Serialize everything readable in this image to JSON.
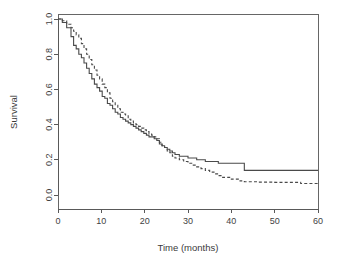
{
  "figure": {
    "background_color": "#ffffff",
    "ink_color": "#4a4a4a",
    "width": 337,
    "height": 265
  },
  "chart_data": {
    "type": "line",
    "title": "",
    "subtitle": "",
    "xlabel": "Time (months)",
    "ylabel": "Survival",
    "xlim": [
      0,
      60
    ],
    "ylim": [
      0,
      1.0
    ],
    "xticks": [
      0,
      10,
      20,
      30,
      40,
      50,
      60
    ],
    "xtick_labels": [
      "0",
      "10",
      "20",
      "30",
      "40",
      "50",
      "60"
    ],
    "yticks": [
      0.0,
      0.2,
      0.4,
      0.6,
      0.8,
      1.0
    ],
    "ytick_labels": [
      "0.0",
      "0.2",
      "0.4",
      "0.6",
      "0.8",
      "1.0"
    ],
    "grid": false,
    "legend": null,
    "legend_position": "none",
    "annotations": [],
    "plot_style": "kaplan-meier-step",
    "series": [
      {
        "name": "Group 1",
        "style": "solid",
        "color": "#4a4a4a",
        "x": [
          0,
          1,
          2,
          3,
          3.6,
          4.2,
          4.8,
          5.4,
          6,
          6.6,
          7.2,
          7.8,
          8.4,
          9,
          9.6,
          10.2,
          10.8,
          11.4,
          12,
          12.6,
          13.2,
          13.8,
          14.4,
          15,
          15.6,
          16.2,
          16.8,
          17.4,
          18,
          18.6,
          19.2,
          19.8,
          20.4,
          21,
          21.6,
          22.2,
          22.8,
          23.4,
          24,
          24.6,
          25.2,
          25.8,
          26.4,
          27,
          28,
          29,
          30,
          31,
          32,
          33,
          34,
          35,
          36,
          37,
          38,
          39,
          40,
          41,
          42,
          43,
          46,
          50,
          55,
          60
        ],
        "y": [
          1.0,
          0.98,
          0.95,
          0.9,
          0.85,
          0.83,
          0.8,
          0.78,
          0.75,
          0.72,
          0.69,
          0.66,
          0.63,
          0.61,
          0.59,
          0.56,
          0.55,
          0.52,
          0.51,
          0.49,
          0.47,
          0.46,
          0.44,
          0.43,
          0.42,
          0.41,
          0.4,
          0.39,
          0.38,
          0.37,
          0.36,
          0.35,
          0.34,
          0.33,
          0.33,
          0.32,
          0.31,
          0.29,
          0.28,
          0.27,
          0.26,
          0.25,
          0.24,
          0.23,
          0.22,
          0.22,
          0.21,
          0.21,
          0.2,
          0.2,
          0.19,
          0.19,
          0.19,
          0.18,
          0.18,
          0.18,
          0.18,
          0.18,
          0.18,
          0.14,
          0.14,
          0.14,
          0.14,
          0.14
        ]
      },
      {
        "name": "Group 2",
        "style": "dashed",
        "color": "#4a4a4a",
        "x": [
          0,
          1,
          2,
          3,
          3.6,
          4.2,
          4.8,
          5.4,
          6,
          6.6,
          7.2,
          7.8,
          8.4,
          9,
          9.6,
          10.2,
          10.8,
          11.4,
          12,
          12.6,
          13.2,
          13.8,
          14.4,
          15,
          15.6,
          16.2,
          16.8,
          17.4,
          18,
          18.6,
          19.2,
          19.8,
          20.4,
          21,
          21.6,
          22.2,
          22.8,
          23.4,
          24,
          24.6,
          25.2,
          25.8,
          26.4,
          27,
          28,
          29,
          30,
          31,
          32,
          33,
          34,
          35,
          36,
          37,
          38,
          39,
          40,
          41,
          42,
          43,
          46,
          50,
          55,
          56,
          60
        ],
        "y": [
          1.0,
          0.99,
          0.97,
          0.95,
          0.93,
          0.91,
          0.89,
          0.86,
          0.83,
          0.8,
          0.77,
          0.74,
          0.71,
          0.68,
          0.66,
          0.63,
          0.61,
          0.58,
          0.55,
          0.53,
          0.51,
          0.49,
          0.47,
          0.46,
          0.45,
          0.43,
          0.42,
          0.41,
          0.4,
          0.39,
          0.38,
          0.37,
          0.36,
          0.35,
          0.34,
          0.33,
          0.32,
          0.3,
          0.28,
          0.27,
          0.25,
          0.24,
          0.22,
          0.21,
          0.2,
          0.19,
          0.18,
          0.17,
          0.16,
          0.15,
          0.14,
          0.13,
          0.12,
          0.11,
          0.1,
          0.1,
          0.09,
          0.09,
          0.08,
          0.075,
          0.073,
          0.072,
          0.072,
          0.065,
          0.065
        ]
      }
    ]
  },
  "geometry": {
    "plot_left": 58,
    "plot_right": 318,
    "plot_top": 14,
    "plot_bottom": 209,
    "y_value_top": 1.0,
    "y_pixel_top": 19,
    "y_value_bottom": 0.0,
    "y_pixel_bottom": 195,
    "x_value_left": 0,
    "x_pixel_left": 58,
    "x_value_right": 60,
    "x_pixel_right": 318,
    "tick_length": 4,
    "xlabel_y": 251,
    "ylabel_x": 17
  }
}
